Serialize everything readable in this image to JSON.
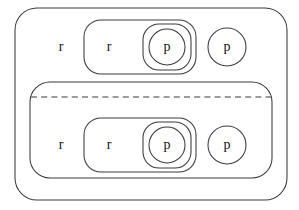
{
  "diagram": {
    "type": "nested-containment-diagram",
    "width": 299,
    "height": 210,
    "background_color": "#ffffff",
    "stroke_color": "#3a3a3a",
    "label_color": "#111111",
    "labels": {
      "r": "r",
      "p": "p"
    },
    "outer_region": {
      "name": "outer-region",
      "shape": "rounded-rectangle",
      "x": 15,
      "y": 8,
      "width": 272,
      "height": 192,
      "radius": 22
    },
    "upper_row": {
      "name": "upper-row",
      "free_label": "r",
      "free_label_x": 61,
      "free_label_y": 47,
      "inner_region": {
        "name": "upper-inner-region",
        "shape": "rounded-rectangle",
        "x": 84,
        "y": 20,
        "width": 112,
        "height": 54,
        "radius": 17,
        "label": "r",
        "label_x": 109,
        "label_y": 47
      },
      "nested_p": {
        "name": "upper-nested-p",
        "outer_shape": "rounded-rectangle",
        "outer_x": 143,
        "outer_y": 24,
        "outer_width": 48,
        "outer_height": 46,
        "outer_radius": 16,
        "circle_cx": 167,
        "circle_cy": 47,
        "circle_r": 18,
        "label": "p"
      },
      "free_p": {
        "name": "upper-free-p",
        "shape": "circle",
        "cx": 227,
        "cy": 47,
        "r": 19,
        "label": "p"
      }
    },
    "lower_region": {
      "name": "lower-region",
      "shape": "rounded-rectangle",
      "x": 30,
      "y": 82,
      "width": 242,
      "height": 96,
      "radius": 20,
      "divider": {
        "name": "dashed-divider",
        "style": "dashed",
        "x1": 31,
        "x2": 271,
        "y": 97
      },
      "free_label": "r",
      "free_label_x": 61,
      "free_label_y": 144,
      "inner_region": {
        "name": "lower-inner-region",
        "shape": "rounded-rectangle",
        "x": 84,
        "y": 118,
        "width": 112,
        "height": 54,
        "radius": 17,
        "label": "r",
        "label_x": 109,
        "label_y": 145
      },
      "nested_p": {
        "name": "lower-nested-p",
        "outer_shape": "rounded-rectangle",
        "outer_x": 143,
        "outer_y": 122,
        "outer_width": 48,
        "outer_height": 46,
        "outer_radius": 16,
        "circle_cx": 167,
        "circle_cy": 145,
        "circle_r": 18,
        "label": "p"
      },
      "free_p": {
        "name": "lower-free-p",
        "shape": "circle",
        "cx": 227,
        "cy": 145,
        "r": 19,
        "label": "p"
      }
    }
  }
}
